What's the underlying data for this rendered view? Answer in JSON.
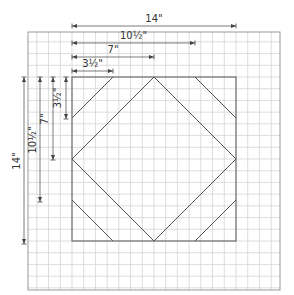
{
  "diagram": {
    "colors": {
      "background": "#ffffff",
      "grid": "#d4d4d4",
      "grid_border": "#9a9a9a",
      "block": "#555555",
      "dimension": "#444444",
      "text": "#333333"
    },
    "grid": {
      "x0": 28,
      "y0": 32,
      "x1": 280,
      "y1": 290,
      "step": 11.7
    },
    "block": {
      "x": 72,
      "y": 77,
      "size": 164,
      "unit_inches": 14
    },
    "horizontal_dimensions": [
      {
        "label": "14\"",
        "y": 26,
        "x1": 72,
        "x2": 236
      },
      {
        "label": "10½\"",
        "y": 43,
        "x1": 72,
        "x2": 195
      },
      {
        "label": "7\"",
        "y": 57,
        "x1": 72,
        "x2": 154
      },
      {
        "label": "3½\"",
        "y": 71,
        "x1": 72,
        "x2": 113
      }
    ],
    "vertical_dimensions": [
      {
        "label": "14\"",
        "x": 24,
        "y1": 77,
        "y2": 244
      },
      {
        "label": "10½\"",
        "x": 40,
        "y1": 77,
        "y2": 202
      },
      {
        "label": "7\"",
        "x": 53,
        "y1": 77,
        "y2": 160
      },
      {
        "label": "3½\"",
        "x": 66,
        "y1": 77,
        "y2": 119
      }
    ]
  }
}
